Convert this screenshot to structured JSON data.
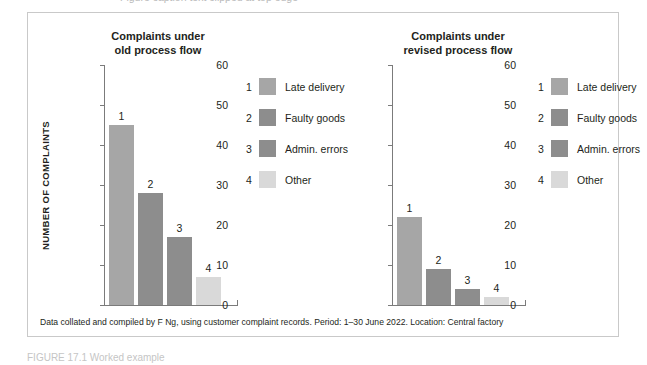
{
  "figure": {
    "top_clipped_text": "Figure caption text clipped at top edge",
    "caption_clipped": "FIGURE 17.1  Worked example",
    "source_note": "Data collated and compiled by F Ng, using customer complaint records. Period: 1–30 June 2022. Location: Central factory"
  },
  "colors": {
    "category_1": "#a6a6a6",
    "category_2": "#8d8d8d",
    "category_3": "#8d8d8d",
    "category_4": "#d9d9d9",
    "axis": "#7b7b7b",
    "border": "#c9c9c9",
    "text": "#231f20"
  },
  "chart_data": [
    {
      "type": "bar",
      "title": "Complaints under old process flow",
      "title_line1": "Complaints under",
      "title_line2": "old process flow",
      "xlabel": "",
      "ylabel": "NUMBER OF COMPLAINTS",
      "ylim": [
        0,
        60
      ],
      "yticks": [
        0,
        10,
        20,
        30,
        40,
        50,
        60
      ],
      "grid": false,
      "legend_position": "right",
      "categories": [
        "Late delivery",
        "Faulty goods",
        "Admin. errors",
        "Other"
      ],
      "point_labels": [
        "1",
        "2",
        "3",
        "4"
      ],
      "values": [
        45,
        28,
        17,
        7
      ]
    },
    {
      "type": "bar",
      "title": "Complaints under revised process flow",
      "title_line1": "Complaints under",
      "title_line2": "revised process flow",
      "xlabel": "",
      "ylabel": "",
      "ylim": [
        0,
        60
      ],
      "yticks": [
        0,
        10,
        20,
        30,
        40,
        50,
        60
      ],
      "grid": false,
      "legend_position": "right",
      "categories": [
        "Late delivery",
        "Faulty goods",
        "Admin. errors",
        "Other"
      ],
      "point_labels": [
        "1",
        "2",
        "3",
        "4"
      ],
      "values": [
        22,
        9,
        4,
        2
      ]
    }
  ]
}
